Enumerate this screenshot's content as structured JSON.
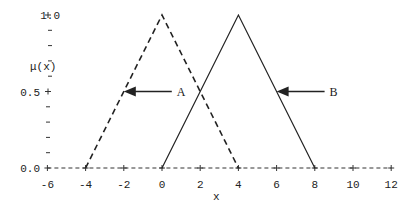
{
  "chart_data": {
    "type": "line",
    "title": "",
    "xlabel": "x",
    "ylabel": "μ(x)",
    "xlim": [
      -6,
      12
    ],
    "ylim": [
      0,
      1
    ],
    "x_ticks": [
      -6,
      -4,
      -2,
      0,
      2,
      4,
      6,
      8,
      10,
      12
    ],
    "x_tick_labels": [
      "-6",
      "-4",
      "-2",
      "0",
      "2",
      "4",
      "6",
      "8",
      "10",
      "12"
    ],
    "y_ticks_labeled": [
      0.0,
      0.5,
      1.0
    ],
    "y_tick_labels": [
      "0.0",
      "0.5",
      "1.0"
    ],
    "y_minor_ticks": [
      0.1,
      0.2,
      0.3,
      0.4,
      0.6,
      0.7,
      0.8,
      0.9
    ],
    "grid": false,
    "series": [
      {
        "name": "A",
        "style": "dashed",
        "x": [
          -4,
          0,
          4
        ],
        "y": [
          0,
          1,
          0
        ],
        "annotation_x": -2
      },
      {
        "name": "B",
        "style": "solid",
        "x": [
          0,
          4,
          8
        ],
        "y": [
          0,
          1,
          0
        ],
        "annotation_x": 6
      }
    ]
  }
}
